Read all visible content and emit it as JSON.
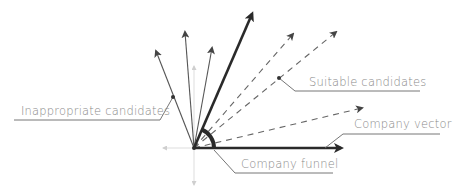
{
  "labels": {
    "inappropriate": "Inappropriate candidates",
    "suitable": "Suitable candidates",
    "company_vector": "Company vector",
    "company_funnel": "Company funnel"
  },
  "colors": {
    "line": "#555555",
    "bold": "#2a2a2a",
    "axis": "#cfcfcf",
    "text": "#8a8a8a"
  },
  "vectors": {
    "origin": [
      194,
      148
    ],
    "inappropriate_tips": [
      [
        154,
        47
      ],
      [
        185,
        28
      ],
      [
        213,
        44
      ]
    ],
    "company_vector_tip": [
      254,
      10
    ],
    "suitable_tips": [
      [
        296,
        30
      ],
      [
        340,
        28
      ],
      [
        366,
        107
      ]
    ],
    "company_funnel_tip": [
      345,
      148
    ]
  }
}
